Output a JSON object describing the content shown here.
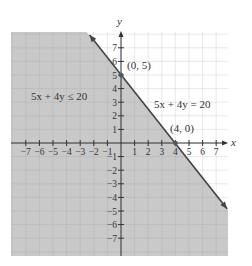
{
  "chart_data": {
    "type": "inequality-graph",
    "title": "",
    "xlabel": "x",
    "ylabel": "y",
    "xlim": [
      -8,
      8
    ],
    "ylim": [
      -8,
      8
    ],
    "grid": true,
    "x_ticks": [
      -7,
      -6,
      -5,
      -4,
      -3,
      -2,
      -1,
      1,
      2,
      3,
      4,
      5,
      6,
      7
    ],
    "y_ticks": [
      -7,
      -6,
      -5,
      -4,
      -3,
      -2,
      -1,
      1,
      2,
      3,
      4,
      5,
      6,
      7
    ],
    "boundary_line": {
      "equation": "5x + 4y = 20",
      "style": "solid",
      "points": [
        [
          0,
          5
        ],
        [
          4,
          0
        ]
      ]
    },
    "shaded_region": "5x + 4y ≤ 20",
    "annotations": [
      {
        "text": "(0, 5)",
        "point": [
          0,
          5
        ]
      },
      {
        "text": "(4, 0)",
        "point": [
          4,
          0
        ]
      },
      {
        "text": "5x + 4y = 20",
        "position": "right of line"
      },
      {
        "text": "5x + 4y ≤ 20",
        "position": "shaded region"
      }
    ],
    "colors": {
      "shade": "#c9c9c9",
      "grid_shaded": "#b0b0b0",
      "grid_unshaded": "#e4e4e4",
      "line": "#444444",
      "axis": "#333333"
    }
  },
  "labels": {
    "x_axis": "x",
    "y_axis": "y",
    "point_a": "(0, 5)",
    "point_b": "(4, 0)",
    "equation": "5x + 4y = 20",
    "inequality": "5x + 4y ≤ 20"
  }
}
